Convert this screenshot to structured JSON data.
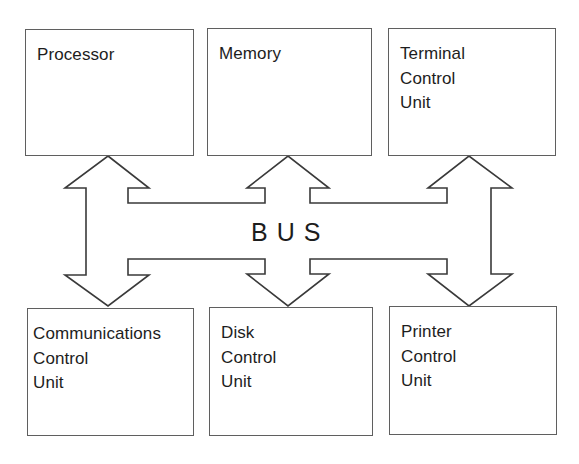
{
  "diagram": {
    "type": "system-bus-block-diagram",
    "top_row": [
      {
        "id": "processor",
        "lines": [
          "Processor"
        ]
      },
      {
        "id": "memory",
        "lines": [
          "Memory"
        ]
      },
      {
        "id": "terminal",
        "lines": [
          "Terminal",
          "Control",
          "Unit"
        ]
      }
    ],
    "bottom_row": [
      {
        "id": "comms",
        "lines": [
          "Communications",
          "Control",
          "Unit"
        ]
      },
      {
        "id": "disk",
        "lines": [
          "Disk",
          "Control",
          "Unit"
        ]
      },
      {
        "id": "printer",
        "lines": [
          "Printer",
          "Control",
          "Unit"
        ]
      }
    ],
    "bus": {
      "label": "BUS",
      "connections": [
        {
          "from": "bus",
          "to": "processor",
          "direction": "bidirectional"
        },
        {
          "from": "bus",
          "to": "memory",
          "direction": "bidirectional"
        },
        {
          "from": "bus",
          "to": "terminal",
          "direction": "bidirectional"
        },
        {
          "from": "bus",
          "to": "comms",
          "direction": "bidirectional"
        },
        {
          "from": "bus",
          "to": "disk",
          "direction": "bidirectional"
        },
        {
          "from": "bus",
          "to": "printer",
          "direction": "bidirectional"
        }
      ]
    },
    "colors": {
      "stroke": "#3a3a3a",
      "box_border": "#5f5f5f",
      "text": "#1d1d1d",
      "background": "#ffffff"
    }
  }
}
